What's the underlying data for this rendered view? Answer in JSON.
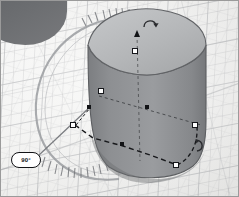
{
  "app": {
    "name": "3D CAD viewport",
    "view_label": "Perspective"
  },
  "angle_readout": {
    "name": "rotation-angle-badge",
    "value": "90°",
    "units": "degrees",
    "border_color": "#121316",
    "fill_color": "#ffffff"
  },
  "scene": {
    "background_color": "#f2f2f0",
    "grid_color": "#808488",
    "solid": {
      "label": "cylinder",
      "top_face_color": "#b9bbbd",
      "body_color": "#8e9093",
      "shadow_color": "#6e7073",
      "edge_color": "#5a5c5f"
    },
    "corner_solid": {
      "label": "adjacent-solid",
      "color": "#6c6e71"
    }
  },
  "gizmo": {
    "name": "gumball-rotation-gizmo",
    "dial_color": "#9a9ca0",
    "dial_tick_color": "#84868a",
    "handles": [
      {
        "id": "translate-z-cone",
        "type": "cone",
        "x": 137,
        "y": 33
      },
      {
        "id": "scale-z-square",
        "type": "square",
        "x": 134,
        "y": 50
      },
      {
        "id": "scale-x-square",
        "type": "square",
        "x": 100,
        "y": 90
      },
      {
        "id": "gumball-origin",
        "type": "dot",
        "x": 146,
        "y": 106
      },
      {
        "id": "rotate-pivot-dot",
        "type": "dot",
        "x": 88,
        "y": 106
      },
      {
        "id": "rotate-start-square",
        "type": "square",
        "x": 72,
        "y": 124
      },
      {
        "id": "rotate-mid-dot",
        "type": "dot",
        "x": 121,
        "y": 143
      },
      {
        "id": "scale-y-square",
        "type": "square",
        "x": 194,
        "y": 124
      },
      {
        "id": "rotate-end-square",
        "type": "square",
        "x": 175,
        "y": 164
      }
    ]
  },
  "cursors": [
    {
      "id": "rotate-cursor-top",
      "glyph": "↷",
      "x": 148,
      "y": 20
    },
    {
      "id": "rotate-cursor-bottom",
      "glyph": "↷",
      "x": 197,
      "y": 143
    }
  ]
}
